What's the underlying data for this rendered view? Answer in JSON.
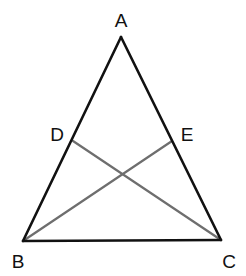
{
  "diagram": {
    "type": "geometry-triangle",
    "colors": {
      "side": "#111111",
      "cevian": "#6e6e6e",
      "label": "#111111",
      "background": "#ffffff"
    },
    "points": {
      "A": {
        "label": "A",
        "x": 121,
        "y": 37
      },
      "B": {
        "label": "B",
        "x": 23,
        "y": 241
      },
      "C": {
        "label": "C",
        "x": 221,
        "y": 240
      },
      "D": {
        "label": "D",
        "x": 73,
        "y": 141
      },
      "E": {
        "label": "E",
        "x": 172,
        "y": 141
      }
    },
    "labels": {
      "A": {
        "text": "A",
        "x": 121,
        "y": 27
      },
      "B": {
        "text": "B",
        "x": 18,
        "y": 268
      },
      "C": {
        "text": "C",
        "x": 229,
        "y": 268
      },
      "D": {
        "text": "D",
        "x": 57,
        "y": 141
      },
      "E": {
        "text": "E",
        "x": 187,
        "y": 141
      }
    },
    "segments": [
      {
        "name": "AB",
        "from": "A",
        "to": "B",
        "style": "side"
      },
      {
        "name": "AC",
        "from": "A",
        "to": "C",
        "style": "side"
      },
      {
        "name": "BC",
        "from": "B",
        "to": "C",
        "style": "side"
      },
      {
        "name": "CD",
        "from": "D",
        "to": "C",
        "style": "cevian"
      },
      {
        "name": "BE",
        "from": "B",
        "to": "E",
        "style": "cevian"
      }
    ]
  }
}
